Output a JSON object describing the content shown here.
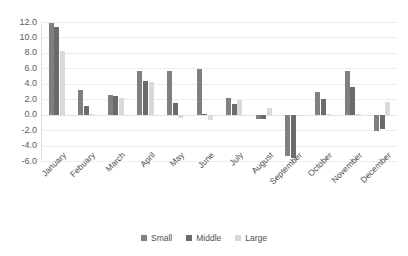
{
  "chart_data": {
    "type": "bar",
    "title": "",
    "xlabel": "",
    "ylabel": "",
    "ylim": [
      -6.0,
      12.0
    ],
    "ytick_step": 2.0,
    "yticks": [
      "12.0",
      "10.0",
      "8.0",
      "6.0",
      "4.0",
      "2.0",
      "0.0",
      "-2.0",
      "-4.0",
      "-6.0"
    ],
    "ytick_values": [
      12.0,
      10.0,
      8.0,
      6.0,
      4.0,
      2.0,
      0.0,
      -2.0,
      -4.0,
      -6.0
    ],
    "grid": true,
    "grid_axis": "y",
    "legend_position": "bottom-center",
    "categories": [
      "January",
      "Febuary",
      "March",
      "April",
      "May",
      "June",
      "July",
      "August",
      "September",
      "October",
      "November",
      "December"
    ],
    "series": [
      {
        "name": "Small",
        "color": "#808080",
        "values": [
          11.9,
          3.2,
          2.6,
          5.7,
          5.6,
          5.9,
          2.1,
          -0.5,
          -5.4,
          3.0,
          5.6,
          -2.1
        ]
      },
      {
        "name": "Middle",
        "color": "#6b6b6b",
        "values": [
          11.3,
          1.1,
          2.4,
          4.4,
          1.5,
          0.1,
          1.4,
          -0.6,
          -5.6,
          2.0,
          3.6,
          -1.9
        ]
      },
      {
        "name": "Large",
        "color": "#d9d9d9",
        "values": [
          8.2,
          0.1,
          2.1,
          4.2,
          -0.4,
          -0.7,
          1.9,
          0.9,
          -0.2,
          0.1,
          0.1,
          1.6
        ]
      }
    ]
  },
  "legend": {
    "items": [
      {
        "label": "Small",
        "color": "#808080"
      },
      {
        "label": "Middle",
        "color": "#6b6b6b"
      },
      {
        "label": "Large",
        "color": "#d9d9d9"
      }
    ]
  }
}
